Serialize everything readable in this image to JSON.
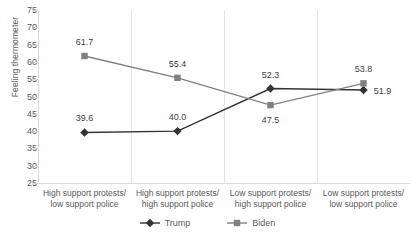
{
  "chart_data": {
    "type": "line",
    "title": "",
    "xlabel": "",
    "ylabel": "Feeling thermometer",
    "ylim": [
      25,
      75
    ],
    "ytick_step": 5,
    "yticks": [
      75,
      70,
      65,
      60,
      55,
      50,
      45,
      40,
      35,
      30,
      25
    ],
    "grid": "vertical-category-separators",
    "legend_position": "bottom-center",
    "categories": [
      "High support protests/ low support police",
      "High support protests/ high support police",
      "Low support protests/ high support police",
      "Low support protests/ low support police"
    ],
    "categories_lines": [
      [
        "High support protests/",
        "low support police"
      ],
      [
        "High support protests/",
        "high support police"
      ],
      [
        "Low support protests/",
        "high support police"
      ],
      [
        "Low support protests/",
        "low support police"
      ]
    ],
    "series": [
      {
        "name": "Trump",
        "color": "#333333",
        "marker": "diamond",
        "values": [
          39.6,
          40.0,
          52.3,
          51.9
        ],
        "labels": [
          "39.6",
          "40.0",
          "52.3",
          "51.9"
        ]
      },
      {
        "name": "Biden",
        "color": "#808080",
        "marker": "square",
        "values": [
          61.7,
          55.4,
          47.5,
          53.8
        ],
        "labels": [
          "61.7",
          "55.4",
          "47.5",
          "53.8"
        ]
      }
    ]
  },
  "axis": {
    "y_label": "Feeling thermometer",
    "y_tick_labels": [
      "75",
      "70",
      "65",
      "60",
      "55",
      "50",
      "45",
      "40",
      "35",
      "30",
      "25"
    ]
  },
  "legend": {
    "items": [
      {
        "label": "Trump",
        "color": "#333333",
        "marker": "diamond"
      },
      {
        "label": "Biden",
        "color": "#808080",
        "marker": "square"
      }
    ]
  },
  "colors": {
    "trump": "#333333",
    "biden": "#808080",
    "grid": "#e4e4e4",
    "axis": "#d9d9d9",
    "text": "#595959",
    "data_label_text": "#404040",
    "background": "#ffffff"
  }
}
